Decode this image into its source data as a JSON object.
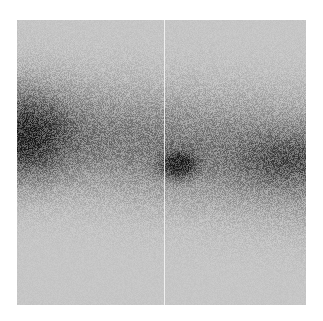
{
  "image": {
    "kind": "grayscale noisy density image",
    "background_color": "#c6c6c6",
    "page_color": "#ffffff",
    "panel": {
      "x": 17,
      "y": 20,
      "width": 289,
      "height": 285
    },
    "seam_line": {
      "x_in_panel": 147,
      "color": "#f4f4f4"
    },
    "band": {
      "description": "diagonal dark band sloping down from left to right",
      "left_center_y": 110,
      "right_center_y": 140,
      "half_width_left": 62,
      "half_width_right": 70,
      "strength": 0.45
    },
    "blobs": [
      {
        "name": "left-edge-dark-region",
        "cx": 8,
        "cy": 118,
        "rx": 48,
        "ry": 50,
        "strength": 0.55
      },
      {
        "name": "central-dark-spot",
        "cx": 161,
        "cy": 145,
        "rx": 20,
        "ry": 15,
        "strength": 0.75
      },
      {
        "name": "right-band-dark-region",
        "cx": 270,
        "cy": 140,
        "rx": 55,
        "ry": 30,
        "strength": 0.3
      }
    ],
    "noise_amplitude": 0.5,
    "seed": 7
  }
}
